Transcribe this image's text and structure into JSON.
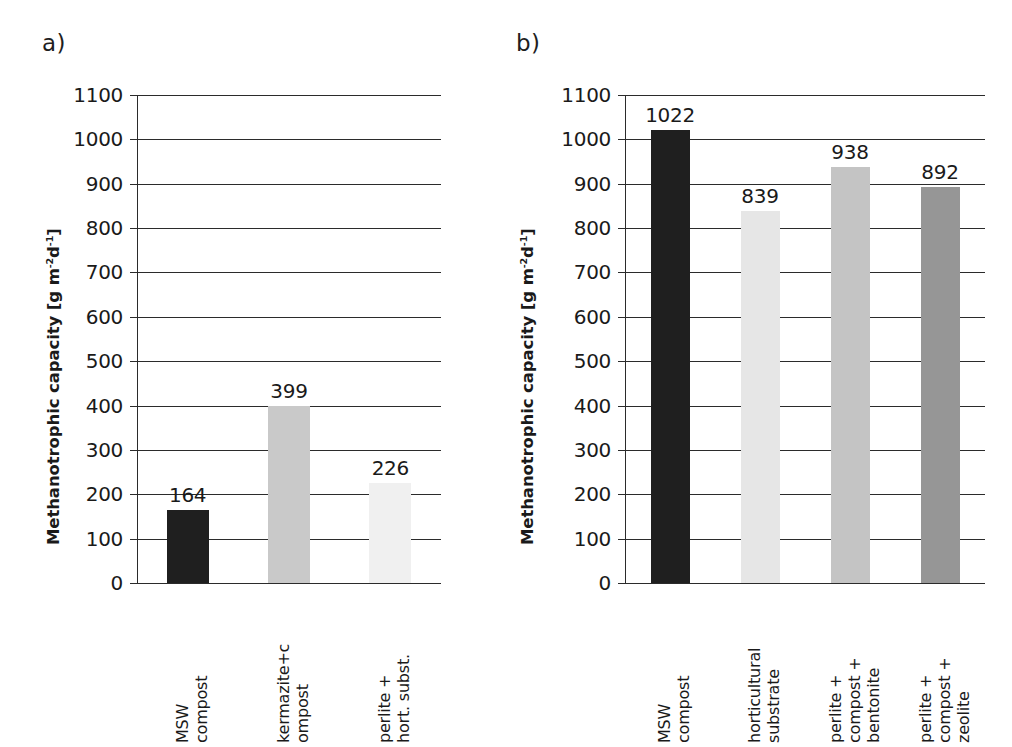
{
  "figure": {
    "background": "#ffffff",
    "panel_labels": [
      "a)",
      "b)"
    ],
    "axis_title_main": "Methanotrophic capacity [g m",
    "axis_title_sup1": "-2",
    "axis_title_mid": "d",
    "axis_title_sup2": "-1",
    "axis_title_end": "]"
  },
  "chart_data": [
    {
      "type": "bar",
      "panel": "a)",
      "title": "",
      "xlabel": "",
      "ylabel": "Methanotrophic capacity [g m-2d-1]",
      "ylim": [
        0,
        1100
      ],
      "ytick_step": 100,
      "yticks": [
        0,
        100,
        200,
        300,
        400,
        500,
        600,
        700,
        800,
        900,
        1000,
        1100
      ],
      "ytick_labels": [
        "0",
        "100",
        "200",
        "300",
        "400",
        "500",
        "600",
        "700",
        "800",
        "900",
        "1000",
        "1100"
      ],
      "grid": true,
      "legend": "none",
      "categories": [
        "MSW compost",
        "kermazite+c ompost",
        "perlite + hort. subst."
      ],
      "category_lines": [
        [
          "MSW",
          "compost"
        ],
        [
          "kermazite+c",
          "ompost"
        ],
        [
          "perlite +",
          "hort. subst."
        ]
      ],
      "values": [
        164,
        399,
        226
      ],
      "value_labels": [
        "164",
        "399",
        "226"
      ],
      "bar_colors": [
        "#1f1f1f",
        "#c9c9c9",
        "#f0f0f0"
      ]
    },
    {
      "type": "bar",
      "panel": "b)",
      "title": "",
      "xlabel": "",
      "ylabel": "Methanotrophic capacity [g m-2d-1]",
      "ylim": [
        0,
        1100
      ],
      "ytick_step": 100,
      "yticks": [
        0,
        100,
        200,
        300,
        400,
        500,
        600,
        700,
        800,
        900,
        1000,
        1100
      ],
      "ytick_labels": [
        "0",
        "100",
        "200",
        "300",
        "400",
        "500",
        "600",
        "700",
        "800",
        "900",
        "1000",
        "1100"
      ],
      "grid": true,
      "legend": "none",
      "categories": [
        "MSW compost",
        "horticultural substrate",
        "perlite + compost + bentonite",
        "perlite + compost + zeolite"
      ],
      "category_lines": [
        [
          "MSW",
          "compost"
        ],
        [
          "horticultural",
          "substrate"
        ],
        [
          "perlite +",
          "compost +",
          "bentonite"
        ],
        [
          "perlite +",
          "compost +",
          "zeolite"
        ]
      ],
      "values": [
        1022,
        839,
        938,
        892
      ],
      "value_labels": [
        "1022",
        "839",
        "938",
        "892"
      ],
      "bar_colors": [
        "#1f1f1f",
        "#e6e6e6",
        "#c4c4c4",
        "#969696"
      ]
    }
  ]
}
